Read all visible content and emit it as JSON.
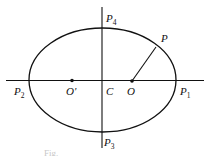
{
  "diagram": {
    "type": "ellipse-geometry",
    "colors": {
      "stroke": "#111111",
      "background": "#ffffff",
      "caption": "#c8c8c8"
    },
    "ellipse": {
      "cx": 102.5,
      "cy": 80,
      "rx": 73.5,
      "ry": 52
    },
    "axes": {
      "horizontal": {
        "x1": 6,
        "y1": 80.5,
        "x2": 204,
        "y2": 80.5
      },
      "vertical": {
        "x1": 102,
        "y1": 7,
        "x2": 102,
        "y2": 148
      }
    },
    "segment_OP": {
      "x1": 132,
      "y1": 81,
      "x2": 156,
      "y2": 47
    },
    "points": [
      {
        "id": "O",
        "x": 132,
        "y": 81,
        "dot": true
      },
      {
        "id": "O_prime",
        "x": 72,
        "y": 80.5,
        "dot": true
      }
    ],
    "labels": [
      {
        "id": "P4",
        "base": "P",
        "sub": "4",
        "x": 106,
        "y": 22
      },
      {
        "id": "P",
        "base": "P",
        "sub": "",
        "x": 161,
        "y": 42
      },
      {
        "id": "P2",
        "base": "P",
        "sub": "2",
        "x": 14,
        "y": 95
      },
      {
        "id": "O_prime",
        "base": "O'",
        "sub": "",
        "x": 66,
        "y": 95
      },
      {
        "id": "C",
        "base": "C",
        "sub": "",
        "x": 106,
        "y": 95
      },
      {
        "id": "O",
        "base": "O",
        "sub": "",
        "x": 127,
        "y": 95
      },
      {
        "id": "P1",
        "base": "P",
        "sub": "1",
        "x": 180,
        "y": 95
      },
      {
        "id": "P3",
        "base": "P",
        "sub": "3",
        "x": 104,
        "y": 146
      }
    ],
    "caption": "Fig."
  }
}
